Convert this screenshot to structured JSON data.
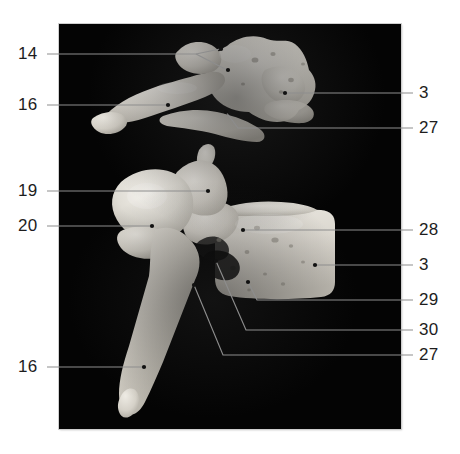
{
  "figure": {
    "kind": "anatomical-photograph-plate",
    "background_color": "#ffffff",
    "plate_color": "#040404",
    "bone_color": "#d9d6cf",
    "leader_color": "#8d8d8d",
    "label_color": "#1d1d1d",
    "plate": {
      "x": 59,
      "y": 24,
      "width": 342,
      "height": 405
    }
  },
  "specimens": [
    {
      "name": "upper-vertebra",
      "view": "lateral"
    },
    {
      "name": "lower-vertebra",
      "view": "lateral"
    }
  ],
  "labels": [
    {
      "id": "label-14",
      "text": "14",
      "side": "left",
      "x": 18,
      "y": 48,
      "specimen": "upper-vertebra"
    },
    {
      "id": "label-16-top",
      "text": "16",
      "side": "left",
      "x": 18,
      "y": 99,
      "specimen": "upper-vertebra"
    },
    {
      "id": "label-3-top",
      "text": "3",
      "side": "right",
      "x": 419,
      "y": 88,
      "specimen": "upper-vertebra"
    },
    {
      "id": "label-27-top",
      "text": "27",
      "side": "right",
      "x": 419,
      "y": 122,
      "specimen": "upper-vertebra"
    },
    {
      "id": "label-19",
      "text": "19",
      "side": "left",
      "x": 18,
      "y": 185,
      "specimen": "lower-vertebra"
    },
    {
      "id": "label-20",
      "text": "20",
      "side": "left",
      "x": 18,
      "y": 220,
      "specimen": "lower-vertebra"
    },
    {
      "id": "label-16-bot",
      "text": "16",
      "side": "left",
      "x": 18,
      "y": 361,
      "specimen": "lower-vertebra"
    },
    {
      "id": "label-28",
      "text": "28",
      "side": "right",
      "x": 419,
      "y": 224,
      "specimen": "lower-vertebra"
    },
    {
      "id": "label-3-bot",
      "text": "3",
      "side": "right",
      "x": 419,
      "y": 259,
      "specimen": "lower-vertebra"
    },
    {
      "id": "label-29",
      "text": "29",
      "side": "right",
      "x": 419,
      "y": 294,
      "specimen": "lower-vertebra"
    },
    {
      "id": "label-30",
      "text": "30",
      "side": "right",
      "x": 419,
      "y": 324,
      "specimen": "lower-vertebra"
    },
    {
      "id": "label-27-bot",
      "text": "27",
      "side": "right",
      "x": 419,
      "y": 349,
      "specimen": "lower-vertebra"
    }
  ]
}
